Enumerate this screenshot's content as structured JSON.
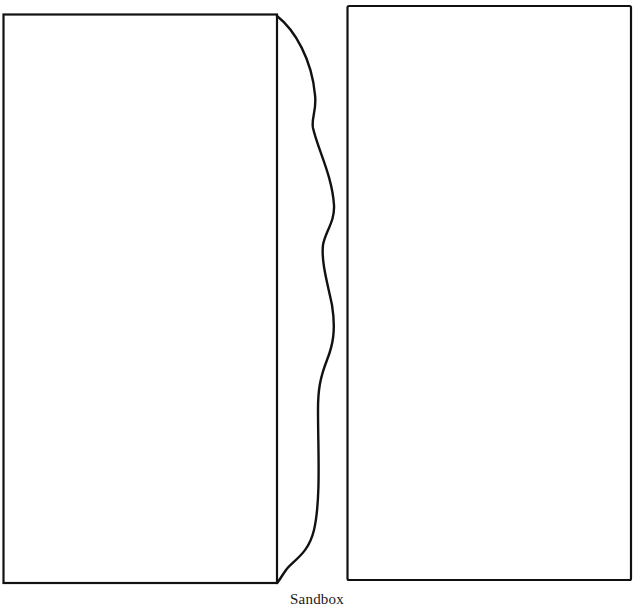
{
  "figure": {
    "caption": "Sandbox",
    "stroke_color": "#111111",
    "background": "#ffffff",
    "shapes": [
      {
        "id": "left-panel",
        "type": "rectangle",
        "x": 3,
        "y": 14,
        "width": 274,
        "height": 569
      },
      {
        "id": "right-panel",
        "type": "rectangle",
        "x": 347,
        "y": 6,
        "width": 284,
        "height": 574
      },
      {
        "id": "wavy-boundary",
        "type": "curve",
        "from": [
          277,
          16
        ],
        "to": [
          277,
          583
        ]
      }
    ]
  }
}
